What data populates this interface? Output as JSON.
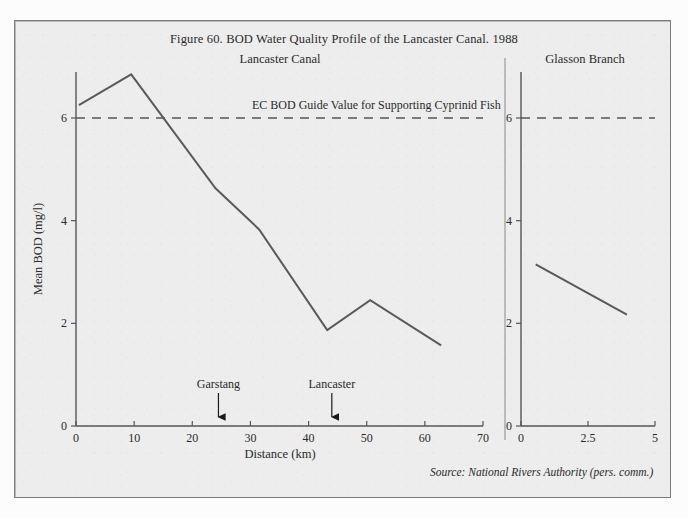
{
  "figure": {
    "title": "Figure 60.  BOD Water Quality Profile of the Lancaster Canal. 1988",
    "source_note": "Source: National Rivers Authority (pers. comm.)",
    "guide_label": "EC BOD Guide Value for Supporting Cyprinid Fish",
    "left_panel_title": "Lancaster Canal",
    "right_panel_title": "Glasson Branch",
    "frame_color": "#7b7b7b",
    "background_color": "#ededed",
    "line_color": "#5a5a5a"
  },
  "chart_data": {
    "type": "line",
    "title": "Figure 60.  BOD Water Quality Profile of the Lancaster Canal. 1988",
    "xlabel": "Distance (km)",
    "ylabel": "Mean BOD (mg/l)",
    "ylim": [
      0,
      7.2
    ],
    "yticks": [
      0,
      2,
      4,
      6
    ],
    "ytick_labels": [
      "0",
      "2",
      "4",
      "6"
    ],
    "grid": false,
    "legend": "none",
    "panels": [
      {
        "name": "Lancaster Canal",
        "xlim": [
          0,
          70
        ],
        "xticks": [
          0,
          10,
          20,
          30,
          40,
          50,
          60,
          70
        ],
        "xtick_labels": [
          "0",
          "10",
          "20",
          "30",
          "40",
          "50",
          "60",
          "70"
        ],
        "series": [
          {
            "name": "Mean BOD",
            "x": [
              0.5,
              9.5,
              24.0,
              31.5,
              43.2,
              50.6,
              62.8
            ],
            "values": [
              6.25,
              6.85,
              4.63,
              3.83,
              1.87,
              2.45,
              1.57
            ]
          }
        ],
        "annotations": [
          {
            "label": "Garstang",
            "x": 24.5,
            "type": "down-arrow"
          },
          {
            "label": "Lancaster",
            "x": 44.0,
            "type": "down-arrow"
          }
        ]
      },
      {
        "name": "Glasson Branch",
        "xlim": [
          0,
          5
        ],
        "xticks": [
          0,
          2.5,
          5
        ],
        "xtick_labels": [
          "0",
          "2.5",
          "5"
        ],
        "series": [
          {
            "name": "Mean BOD",
            "x": [
              0.55,
              3.95
            ],
            "values": [
              3.15,
              2.17
            ]
          }
        ],
        "annotations": []
      }
    ],
    "reference_lines": [
      {
        "label": "EC BOD Guide Value for Supporting Cyprinid Fish",
        "y": 6,
        "style": "dashed"
      }
    ]
  }
}
